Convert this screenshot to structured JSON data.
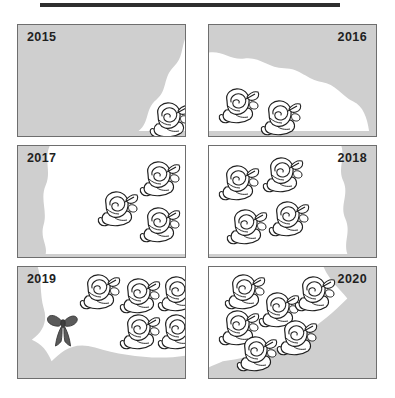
{
  "figure": {
    "title_bar": "",
    "background_color": "#ffffff",
    "panel_fill": "#cfcfcf",
    "panel_border": "#6e6e6e",
    "growth_fill": "#ffffff",
    "ink_color": "#1f1f1f",
    "ribbon_color": "#555555"
  },
  "chart_data": {
    "type": "bar",
    "title": "",
    "subtitle": "",
    "xlabel": "",
    "ylabel": "",
    "categories": [
      "2015",
      "2016",
      "2017",
      "2018",
      "2019",
      "2020"
    ],
    "values": [
      1,
      2,
      3,
      4,
      5,
      6
    ],
    "series": [
      {
        "name": "roses",
        "values": [
          1,
          2,
          3,
          4,
          5,
          6
        ]
      }
    ],
    "ylim": [
      0,
      6
    ],
    "grid": false,
    "legend": "none",
    "annotations": [
      "ribbon bow in 2019 panel"
    ],
    "units": "rose icons"
  },
  "panels": [
    {
      "id": "panel-2015",
      "year": "2015",
      "year_side": "left",
      "rose_count": 1,
      "has_ribbon": false,
      "growth_path": "M 176 4 C 163 16, 170 30, 158 42 C 146 54, 152 66, 140 76 C 128 86, 134 98, 122 108 L 180 108 L 180 4 Z",
      "roses": [
        {
          "x": 130,
          "y": 74,
          "s": 1.0
        }
      ]
    },
    {
      "id": "panel-2016",
      "year": "2016",
      "year_side": "right",
      "rose_count": 2,
      "has_ribbon": false,
      "growth_path": "M 0 28 C 14 26, 22 36, 36 34 C 52 32, 60 44, 76 44 C 92 44, 100 56, 114 58 C 128 60, 134 72, 146 78 C 156 83, 160 94, 162 108 L 0 108 Z",
      "roses": [
        {
          "x": 8,
          "y": 60,
          "s": 1.0
        },
        {
          "x": 50,
          "y": 72,
          "s": 1.0
        }
      ]
    },
    {
      "id": "panel-2017",
      "year": "2017",
      "year_side": "left",
      "rose_count": 3,
      "has_ribbon": false,
      "growth_path": "M 32 0 C 26 14, 34 26, 28 40 C 22 54, 30 66, 26 80 C 22 94, 30 100, 28 110 L 180 110 L 180 0 Z",
      "roses": [
        {
          "x": 120,
          "y": 12,
          "s": 1.0
        },
        {
          "x": 78,
          "y": 42,
          "s": 1.0
        },
        {
          "x": 120,
          "y": 58,
          "s": 1.0
        }
      ]
    },
    {
      "id": "panel-2018",
      "year": "2018",
      "year_side": "right",
      "rose_count": 4,
      "has_ribbon": false,
      "growth_path": "M 0 0 L 134 0 C 138 14, 130 22, 136 36 C 142 50, 132 60, 138 74 C 144 88, 136 96, 140 110 L 0 110 Z",
      "roses": [
        {
          "x": 8,
          "y": 16,
          "s": 1.0
        },
        {
          "x": 52,
          "y": 8,
          "s": 1.0
        },
        {
          "x": 16,
          "y": 60,
          "s": 1.0
        },
        {
          "x": 58,
          "y": 52,
          "s": 1.0
        }
      ]
    },
    {
      "id": "panel-2019",
      "year": "2019",
      "year_side": "left",
      "rose_count": 5,
      "has_ribbon": true,
      "growth_path": "M 20 0 L 180 0 L 180 88 C 150 96, 110 92, 78 82 C 56 75, 44 86, 34 96 C 30 86, 24 78, 14 74 C 26 66, 30 54, 26 42 C 22 28, 24 12, 20 0 Z",
      "ribbon": {
        "x": 28,
        "y": 42
      },
      "roses": [
        {
          "x": 60,
          "y": 4,
          "s": 1.0
        },
        {
          "x": 100,
          "y": 8,
          "s": 1.0
        },
        {
          "x": 138,
          "y": 6,
          "s": 1.0
        },
        {
          "x": 100,
          "y": 44,
          "s": 1.0
        },
        {
          "x": 138,
          "y": 44,
          "s": 1.0
        }
      ]
    },
    {
      "id": "panel-2020",
      "year": "2020",
      "year_side": "right",
      "rose_count": 6,
      "has_ribbon": false,
      "growth_path": "M 0 0 L 116 0 C 122 14, 132 22, 140 32 C 126 46, 112 58, 96 68 C 74 82, 46 92, 14 96 C 10 98, 4 100, 0 102 Z",
      "roses": [
        {
          "x": 14,
          "y": 4,
          "s": 1.0
        },
        {
          "x": 48,
          "y": 22,
          "s": 1.0
        },
        {
          "x": 84,
          "y": 6,
          "s": 1.0
        },
        {
          "x": 8,
          "y": 40,
          "s": 1.0
        },
        {
          "x": 66,
          "y": 50,
          "s": 1.0
        },
        {
          "x": 26,
          "y": 66,
          "s": 1.0
        }
      ]
    }
  ],
  "layout": {
    "columns": 2,
    "rows": 3,
    "panel_width": 169,
    "panel_height": 113,
    "gap_x": 22,
    "gap_y": 8
  }
}
